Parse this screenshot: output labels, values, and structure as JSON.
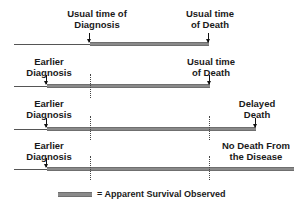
{
  "diagram": {
    "rows": [
      {
        "id": "usual",
        "start_label": [
          "Usual time of",
          "Diagnosis"
        ],
        "end_label": [
          "Usual time",
          "of Death"
        ]
      },
      {
        "id": "earlier-usual-death",
        "start_label": [
          "Earlier",
          "Diagnosis"
        ],
        "end_label": [
          "Usual time",
          "of Death"
        ]
      },
      {
        "id": "earlier-delayed-death",
        "start_label": [
          "Earlier",
          "Diagnosis"
        ],
        "end_label": [
          "Delayed",
          "Death"
        ]
      },
      {
        "id": "earlier-no-death",
        "start_label": [
          "Earlier",
          "Diagnosis"
        ],
        "end_label": [
          "No Death From",
          "the Disease"
        ]
      }
    ],
    "legend": {
      "text": "= Apparent Survival Observed"
    },
    "colors": {
      "bar": "#8a8a8a",
      "line": "#555555",
      "text": "#1a1a1a"
    }
  }
}
